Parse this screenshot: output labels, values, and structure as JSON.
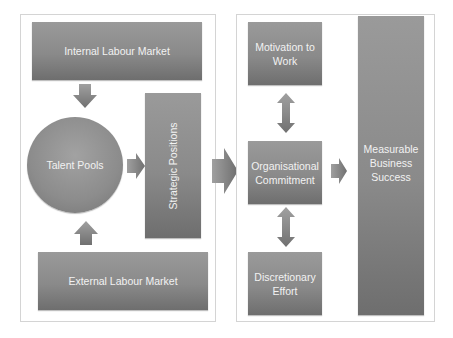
{
  "diagram": {
    "left_panel": {
      "internal_labour_market": "Internal Labour Market",
      "talent_pools": "Talent Pools",
      "strategic_positions": "Strategic Positions",
      "external_labour_market": "External Labour Market"
    },
    "right_panel": {
      "motivation_to_work": "Motivation to Work",
      "organisational_commitment": "Organisational Commitment",
      "discretionary_effort": "Discretionary Effort",
      "measurable_business_success": "Measurable Business Success"
    },
    "colors": {
      "box_fill": "#8a8a8a",
      "arrow_fill": "#888888",
      "text": "#f2f2f2",
      "panel_border": "#d4d4d4"
    }
  }
}
